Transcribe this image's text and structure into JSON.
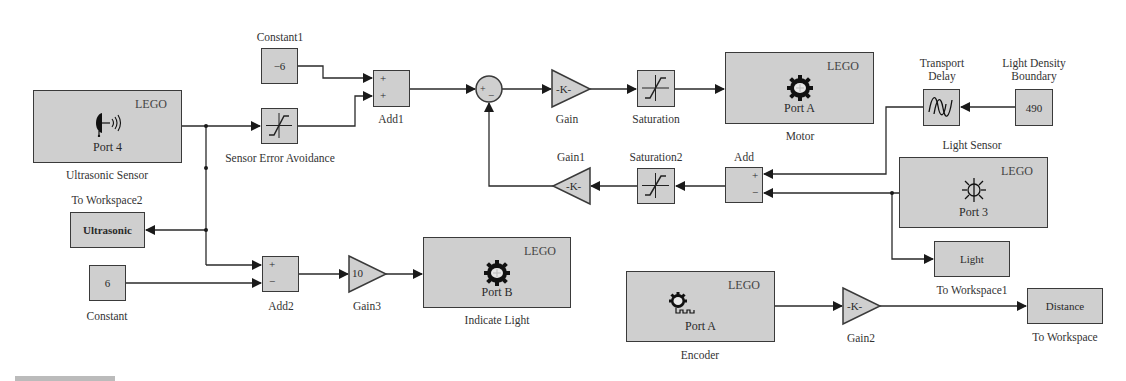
{
  "diagram": {
    "colors": {
      "block_fill": "#cfcfcf",
      "line": "#2a2a2a",
      "background": "#ffffff"
    }
  },
  "blocks": {
    "ultrasonic_sensor": {
      "brand": "LEGO",
      "port": "Port 4",
      "label": "Ultrasonic Sensor",
      "icon": "ultrasonic-speaker-icon"
    },
    "constant1": {
      "value": "−6",
      "label": "Constant1"
    },
    "sensor_error_avoidance": {
      "label": "Sensor Error Avoidance",
      "icon": "saturation-icon"
    },
    "add1": {
      "signs": [
        "+",
        "+"
      ],
      "label": "Add1"
    },
    "sum_junction": {
      "signs": [
        "+",
        "−"
      ]
    },
    "gain": {
      "value": "-K-",
      "label": "Gain"
    },
    "saturation": {
      "label": "Saturation",
      "icon": "saturation-icon"
    },
    "motor": {
      "brand": "LEGO",
      "port": "Port A",
      "label": "Motor",
      "icon": "gear-icon"
    },
    "transport_delay": {
      "label_line1": "Transport",
      "label_line2": "Delay",
      "icon": "transport-delay-icon"
    },
    "light_density_boundary": {
      "value": "490",
      "label_line1": "Light Density",
      "label_line2": "Boundary"
    },
    "light_sensor": {
      "brand": "LEGO",
      "port": "Port 3",
      "label": "Light Sensor",
      "icon": "light-bulb-icon"
    },
    "add": {
      "signs": [
        "+",
        "−"
      ],
      "label": "Add"
    },
    "saturation2": {
      "label": "Saturation2",
      "icon": "saturation-icon"
    },
    "gain1": {
      "value": "-K-",
      "label": "Gain1"
    },
    "to_workspace2": {
      "value": "Ultrasonic",
      "label": "To Workspace2"
    },
    "constant": {
      "value": "6",
      "label": "Constant"
    },
    "add2": {
      "signs": [
        "+",
        "−"
      ],
      "label": "Add2"
    },
    "gain3": {
      "value": "10",
      "label": "Gain3"
    },
    "indicate_light": {
      "brand": "LEGO",
      "port": "Port B",
      "label": "Indicate Light",
      "icon": "gear-icon"
    },
    "to_workspace1": {
      "value": "Light",
      "label": "To Workspace1"
    },
    "encoder": {
      "brand": "LEGO",
      "port": "Port A",
      "label": "Encoder",
      "icon": "encoder-icon"
    },
    "gain2": {
      "value": "-K-",
      "label": "Gain2"
    },
    "to_workspace": {
      "value": "Distance",
      "label": "To Workspace"
    }
  }
}
